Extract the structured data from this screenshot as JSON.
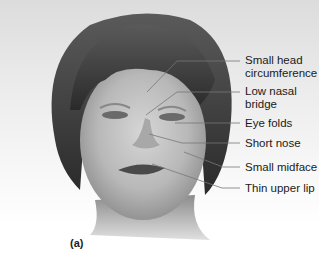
{
  "figure": {
    "panel_label": "(a)",
    "labels": [
      {
        "id": "head",
        "text_line1": "Small head",
        "text_line2": "circumference",
        "y": 54
      },
      {
        "id": "nasal",
        "text_line1": "Low nasal",
        "text_line2": "bridge",
        "y": 85
      },
      {
        "id": "eye",
        "text_line1": "Eye folds",
        "text_line2": "",
        "y": 117
      },
      {
        "id": "nose",
        "text_line1": "Short nose",
        "text_line2": "",
        "y": 137
      },
      {
        "id": "midface",
        "text_line1": "Small midface",
        "text_line2": "",
        "y": 161
      },
      {
        "id": "lip",
        "text_line1": "Thin upper lip",
        "text_line2": "",
        "y": 182
      }
    ]
  }
}
